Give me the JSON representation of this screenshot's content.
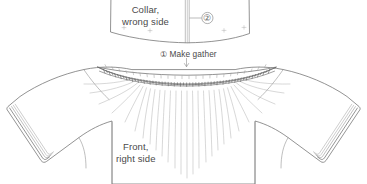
{
  "diagram": {
    "background_color": "#ffffff",
    "line_color": "#6e6e6e",
    "text_color": "#4a4a4a",
    "width": 367,
    "height": 184
  },
  "labels": {
    "collar": {
      "line1": "Collar,",
      "line2": "wrong side"
    },
    "front": {
      "line1": "Front,",
      "line2": "right side"
    },
    "make_gather": "① Make gather"
  },
  "callouts": [
    {
      "id": "2",
      "symbol": "②",
      "target": "collar-center-seam"
    }
  ],
  "steps": [
    {
      "number": "①",
      "text": "Make gather"
    },
    {
      "number": "②",
      "text": ""
    }
  ],
  "pieces": [
    {
      "name": "collar",
      "side": "wrong side"
    },
    {
      "name": "front-bodice",
      "side": "right side"
    },
    {
      "name": "left-sleeve",
      "side": "right side"
    },
    {
      "name": "right-sleeve",
      "side": "right side"
    }
  ]
}
